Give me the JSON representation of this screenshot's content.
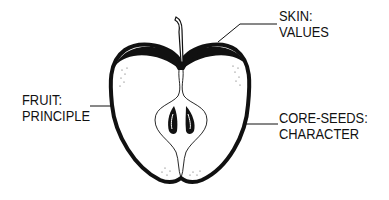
{
  "diagram": {
    "labels": {
      "skin": {
        "line1": "SKIN:",
        "line2": "VALUES"
      },
      "fruit": {
        "line1": "FRUIT:",
        "line2": "PRINCIPLE"
      },
      "core": {
        "line1": "CORE-SEEDS:",
        "line2": "CHARACTER"
      }
    },
    "colors": {
      "ink": "#111111",
      "background": "#ffffff"
    }
  }
}
